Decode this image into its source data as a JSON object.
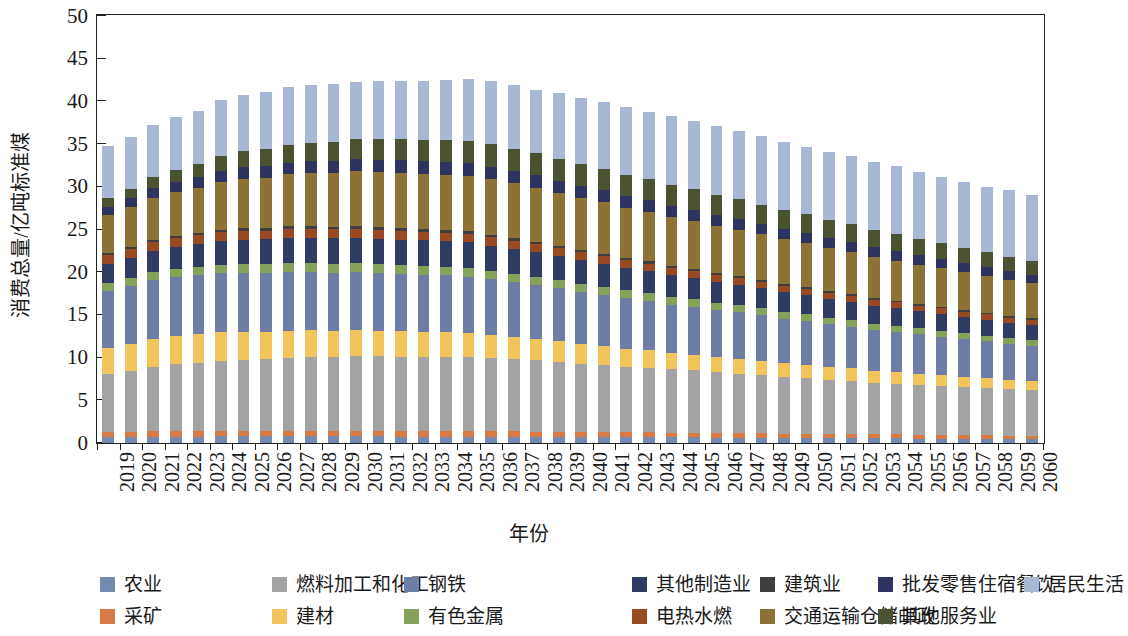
{
  "chart_data": {
    "type": "bar",
    "stacked": true,
    "title": "",
    "xlabel": "年份",
    "ylabel": "消费总量/亿吨标准煤",
    "ylim": [
      0,
      50
    ],
    "yticks": [
      0,
      5,
      10,
      15,
      20,
      25,
      30,
      35,
      40,
      45,
      50
    ],
    "grid": false,
    "legend_position": "bottom",
    "categories": [
      "2019",
      "2020",
      "2021",
      "2022",
      "2023",
      "2024",
      "2025",
      "2026",
      "2027",
      "2028",
      "2029",
      "2030",
      "2031",
      "2032",
      "2033",
      "2034",
      "2035",
      "2036",
      "2037",
      "2038",
      "2039",
      "2040",
      "2041",
      "2042",
      "2043",
      "2044",
      "2045",
      "2046",
      "2047",
      "2048",
      "2049",
      "2050",
      "2051",
      "2052",
      "2053",
      "2054",
      "2055",
      "2056",
      "2057",
      "2058",
      "2059",
      "2060"
    ],
    "totals": [
      34.8,
      35.8,
      37.2,
      38.1,
      38.9,
      40.1,
      40.7,
      41.1,
      41.6,
      41.8,
      42.1,
      42.2,
      42.3,
      42.4,
      42.4,
      42.5,
      42.6,
      42.5,
      41.9,
      41.3,
      40.9,
      40.4,
      39.9,
      39.4,
      39.0,
      38.6,
      38.1,
      37.5,
      36.9,
      36.3,
      35.5,
      34.9,
      34.3,
      33.7,
      33.1,
      32.6,
      31.9,
      31.4,
      30.8,
      30.1,
      29.9,
      29.5
    ],
    "series": [
      {
        "name": "农业",
        "color": "#7689ae",
        "values": [
          0.72,
          0.72,
          0.74,
          0.76,
          0.76,
          0.78,
          0.78,
          0.78,
          0.78,
          0.78,
          0.78,
          0.78,
          0.78,
          0.76,
          0.76,
          0.76,
          0.76,
          0.74,
          0.74,
          0.72,
          0.72,
          0.7,
          0.7,
          0.68,
          0.68,
          0.66,
          0.66,
          0.64,
          0.62,
          0.62,
          0.6,
          0.58,
          0.58,
          0.56,
          0.54,
          0.54,
          0.52,
          0.52,
          0.5,
          0.5,
          0.48,
          0.48
        ]
      },
      {
        "name": "采矿",
        "color": "#d97a45",
        "values": [
          0.62,
          0.62,
          0.64,
          0.66,
          0.66,
          0.68,
          0.68,
          0.68,
          0.68,
          0.68,
          0.68,
          0.68,
          0.66,
          0.66,
          0.66,
          0.66,
          0.64,
          0.64,
          0.62,
          0.62,
          0.6,
          0.6,
          0.58,
          0.58,
          0.56,
          0.56,
          0.54,
          0.54,
          0.52,
          0.52,
          0.5,
          0.5,
          0.48,
          0.48,
          0.46,
          0.46,
          0.44,
          0.44,
          0.42,
          0.42,
          0.4,
          0.4
        ]
      },
      {
        "name": "燃料加工和化工",
        "color": "#a3a3a3",
        "values": [
          6.7,
          7.1,
          7.5,
          7.8,
          8.0,
          8.2,
          8.3,
          8.4,
          8.5,
          8.6,
          8.6,
          8.7,
          8.7,
          8.7,
          8.7,
          8.7,
          8.7,
          8.6,
          8.5,
          8.4,
          8.2,
          8.0,
          7.9,
          7.7,
          7.6,
          7.4,
          7.3,
          7.1,
          7.0,
          6.8,
          6.6,
          6.5,
          6.3,
          6.2,
          6.0,
          5.9,
          5.8,
          5.7,
          5.6,
          5.5,
          5.4,
          5.3
        ]
      },
      {
        "name": "建材",
        "color": "#f2c55c",
        "values": [
          3.1,
          3.2,
          3.3,
          3.3,
          3.3,
          3.3,
          3.3,
          3.2,
          3.2,
          3.2,
          3.1,
          3.1,
          3.0,
          3.0,
          2.9,
          2.9,
          2.8,
          2.7,
          2.6,
          2.5,
          2.4,
          2.3,
          2.2,
          2.1,
          2.0,
          1.9,
          1.85,
          1.8,
          1.75,
          1.7,
          1.65,
          1.6,
          1.55,
          1.5,
          1.45,
          1.4,
          1.35,
          1.3,
          1.25,
          1.2,
          1.15,
          1.1
        ]
      },
      {
        "name": "钢铁",
        "color": "#6d7da6",
        "values": [
          6.7,
          6.8,
          6.9,
          6.9,
          6.9,
          6.9,
          6.9,
          6.9,
          6.9,
          6.8,
          6.8,
          6.8,
          6.8,
          6.7,
          6.7,
          6.6,
          6.6,
          6.5,
          6.4,
          6.3,
          6.2,
          6.1,
          6.0,
          5.9,
          5.8,
          5.7,
          5.6,
          5.5,
          5.4,
          5.3,
          5.2,
          5.1,
          5.0,
          4.9,
          4.8,
          4.7,
          4.6,
          4.5,
          4.4,
          4.3,
          4.2,
          4.1
        ]
      },
      {
        "name": "有色金属",
        "color": "#86a25a",
        "values": [
          0.85,
          0.88,
          0.9,
          0.92,
          0.94,
          0.96,
          0.97,
          0.98,
          0.99,
          1.0,
          1.0,
          1.0,
          1.0,
          1.0,
          1.0,
          1.0,
          0.99,
          0.98,
          0.97,
          0.96,
          0.95,
          0.94,
          0.92,
          0.91,
          0.9,
          0.88,
          0.87,
          0.85,
          0.84,
          0.82,
          0.8,
          0.79,
          0.77,
          0.76,
          0.74,
          0.73,
          0.71,
          0.7,
          0.68,
          0.67,
          0.65,
          0.64
        ]
      },
      {
        "name": "其他制造业",
        "color": "#2f3b63",
        "values": [
          2.3,
          2.4,
          2.5,
          2.6,
          2.7,
          2.8,
          2.9,
          2.9,
          3.0,
          3.0,
          3.0,
          3.0,
          3.0,
          3.0,
          3.0,
          3.0,
          3.0,
          2.95,
          2.9,
          2.85,
          2.8,
          2.75,
          2.7,
          2.65,
          2.6,
          2.55,
          2.5,
          2.45,
          2.4,
          2.35,
          2.3,
          2.25,
          2.2,
          2.15,
          2.1,
          2.05,
          2.0,
          1.95,
          1.9,
          1.85,
          1.8,
          1.8
        ]
      },
      {
        "name": "电热水燃",
        "color": "#9a4a22",
        "values": [
          1.0,
          1.0,
          1.05,
          1.05,
          1.05,
          1.05,
          1.05,
          1.05,
          1.05,
          1.05,
          1.05,
          1.05,
          1.05,
          1.05,
          1.0,
          1.0,
          1.0,
          1.0,
          0.98,
          0.96,
          0.95,
          0.94,
          0.92,
          0.9,
          0.88,
          0.86,
          0.85,
          0.83,
          0.81,
          0.79,
          0.78,
          0.76,
          0.74,
          0.72,
          0.71,
          0.69,
          0.67,
          0.66,
          0.64,
          0.62,
          0.61,
          0.6
        ]
      },
      {
        "name": "建筑业",
        "color": "#3f3f3f",
        "values": [
          0.3,
          0.3,
          0.3,
          0.3,
          0.3,
          0.3,
          0.3,
          0.3,
          0.3,
          0.3,
          0.3,
          0.3,
          0.3,
          0.3,
          0.3,
          0.3,
          0.3,
          0.29,
          0.29,
          0.28,
          0.28,
          0.27,
          0.27,
          0.26,
          0.26,
          0.25,
          0.25,
          0.24,
          0.24,
          0.23,
          0.23,
          0.22,
          0.22,
          0.21,
          0.21,
          0.2,
          0.2,
          0.19,
          0.19,
          0.18,
          0.18,
          0.18
        ]
      },
      {
        "name": "交通运输仓储邮政",
        "color": "#8d7235",
        "values": [
          4.4,
          4.6,
          4.9,
          5.1,
          5.3,
          5.6,
          5.8,
          5.9,
          6.1,
          6.2,
          6.3,
          6.4,
          6.4,
          6.5,
          6.5,
          6.5,
          6.5,
          6.5,
          6.4,
          6.3,
          6.2,
          6.1,
          6.0,
          5.9,
          5.8,
          5.7,
          5.6,
          5.5,
          5.4,
          5.3,
          5.2,
          5.1,
          5.0,
          4.9,
          4.8,
          4.7,
          4.6,
          4.5,
          4.4,
          4.3,
          4.2,
          4.1
        ]
      },
      {
        "name": "批发零售住宿餐饮",
        "color": "#2e3360",
        "values": [
          1.0,
          1.05,
          1.1,
          1.15,
          1.2,
          1.25,
          1.3,
          1.32,
          1.35,
          1.38,
          1.4,
          1.42,
          1.44,
          1.45,
          1.46,
          1.47,
          1.48,
          1.47,
          1.46,
          1.45,
          1.44,
          1.42,
          1.4,
          1.38,
          1.36,
          1.34,
          1.32,
          1.3,
          1.28,
          1.26,
          1.24,
          1.22,
          1.2,
          1.18,
          1.16,
          1.14,
          1.12,
          1.1,
          1.08,
          1.06,
          1.04,
          1.02
        ]
      },
      {
        "name": "其他服务业",
        "color": "#4a5231",
        "values": [
          1.0,
          1.1,
          1.3,
          1.45,
          1.6,
          1.75,
          1.9,
          2.0,
          2.1,
          2.2,
          2.3,
          2.4,
          2.45,
          2.5,
          2.55,
          2.6,
          2.62,
          2.62,
          2.6,
          2.58,
          2.55,
          2.52,
          2.5,
          2.47,
          2.44,
          2.4,
          2.36,
          2.32,
          2.28,
          2.24,
          2.2,
          2.15,
          2.1,
          2.05,
          2.0,
          1.95,
          1.9,
          1.85,
          1.8,
          1.75,
          1.7,
          1.65
        ]
      },
      {
        "name": "居民生活",
        "color": "#a8b8d4",
        "values": [
          6.11,
          6.03,
          6.14,
          6.16,
          6.24,
          6.56,
          6.62,
          6.76,
          6.76,
          6.69,
          6.73,
          6.66,
          6.77,
          6.83,
          6.88,
          7.06,
          7.21,
          7.46,
          7.48,
          7.48,
          7.66,
          7.75,
          7.81,
          7.87,
          7.92,
          8.05,
          8.04,
          8.02,
          8.04,
          8.07,
          7.94,
          7.92,
          7.96,
          7.95,
          7.89,
          7.94,
          7.83,
          7.79,
          7.74,
          7.65,
          7.78,
          7.67
        ]
      }
    ]
  },
  "legend": [
    {
      "label": "农业",
      "color": "#7689ae"
    },
    {
      "label": "采矿",
      "color": "#d97a45"
    },
    {
      "label": "燃料加工和化工",
      "color": "#a3a3a3"
    },
    {
      "label": "建材",
      "color": "#f2c55c"
    },
    {
      "label": "钢铁",
      "color": "#6d7da6"
    },
    {
      "label": "有色金属",
      "color": "#86a25a"
    },
    {
      "label": "其他制造业",
      "color": "#2f3b63"
    },
    {
      "label": "电热水燃",
      "color": "#9a4a22"
    },
    {
      "label": "建筑业",
      "color": "#3f3f3f"
    },
    {
      "label": "交通运输仓储邮政",
      "color": "#8d7235"
    },
    {
      "label": "批发零售住宿餐饮",
      "color": "#2e3360"
    },
    {
      "label": "其他服务业",
      "color": "#4a5231"
    },
    {
      "label": "居民生活",
      "color": "#a8b8d4"
    }
  ]
}
